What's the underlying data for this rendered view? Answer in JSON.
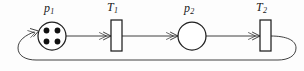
{
  "diagram": {
    "type": "petri-net",
    "title": "",
    "background_color": "#fdfdfd",
    "stroke_color": "#2b2b2b",
    "token_color": "#111111",
    "places": [
      {
        "id": "p1",
        "label_base": "p",
        "label_sub": "1",
        "shape": "circle",
        "cx": 52,
        "cy": 36,
        "r": 14,
        "tokens": 4,
        "token_positions": [
          {
            "cx": 46.5,
            "cy": 30.5
          },
          {
            "cx": 57.5,
            "cy": 30.5
          },
          {
            "cx": 46.5,
            "cy": 41.5
          },
          {
            "cx": 57.5,
            "cy": 41.5
          }
        ],
        "token_r": 2.9,
        "label_x": 44,
        "label_y": 2
      },
      {
        "id": "p2",
        "label_base": "p",
        "label_sub": "2",
        "shape": "circle",
        "cx": 192,
        "cy": 36,
        "r": 14,
        "tokens": 0,
        "token_positions": [],
        "token_r": 2.9,
        "label_x": 184,
        "label_y": 2
      }
    ],
    "transitions": [
      {
        "id": "T1",
        "label_base": "T",
        "label_sub": "1",
        "shape": "rect",
        "x": 111,
        "y": 20,
        "width": 11,
        "height": 31,
        "label_x": 107,
        "label_y": 1
      },
      {
        "id": "T2",
        "label_base": "T",
        "label_sub": "2",
        "shape": "rect",
        "x": 260,
        "y": 20,
        "width": 11,
        "height": 31,
        "label_x": 256,
        "label_y": 1
      }
    ],
    "arcs": [
      {
        "id": "arc-p1-t1",
        "from": "p1",
        "to": "T1",
        "style": "straight",
        "arrowhead": "open"
      },
      {
        "id": "arc-t1-p2",
        "from": "T1",
        "to": "p2",
        "style": "straight",
        "arrowhead": "open"
      },
      {
        "id": "arc-p2-t2",
        "from": "p2",
        "to": "T2",
        "style": "straight",
        "arrowhead": "open"
      },
      {
        "id": "arc-t2-p1",
        "from": "T2",
        "to": "p1",
        "style": "feedback-loop",
        "arrowhead": "open"
      }
    ]
  }
}
